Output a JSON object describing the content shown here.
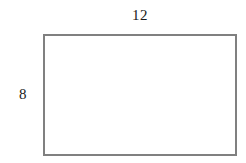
{
  "figure": {
    "type": "rectangle-with-dimension-labels",
    "background_color": "#ffffff",
    "shape": {
      "name": "rectangle",
      "stroke_color": "#808080",
      "fill_color": "#ffffff",
      "stroke_width_px": 2
    },
    "labels": {
      "top": "12",
      "left": "8"
    },
    "label_color": "#1a1a1a"
  }
}
